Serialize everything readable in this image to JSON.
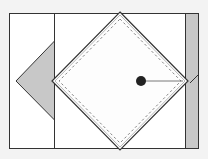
{
  "diagram": {
    "background": "#f3f3f3",
    "stroke_color": "#333333",
    "panel_fill": "#ffffff",
    "shade_fill": "#c8c8c8",
    "dot_color": "#222222",
    "outer_rect": {
      "x": 9.5,
      "y": 13.5,
      "w": 189,
      "h": 135
    },
    "left_divider_x": 54.5,
    "right_strip": {
      "x": 185.5,
      "y": 13.5,
      "w": 13,
      "h": 135
    },
    "left_triangle": [
      [
        54.5,
        41
      ],
      [
        16,
        81
      ],
      [
        54.5,
        120
      ]
    ],
    "diamond": {
      "cx": 120,
      "cy": 81,
      "half_w": 68,
      "half_h": 69
    },
    "dashed_inset": 7,
    "dot": {
      "cx": 141,
      "cy": 81,
      "r": 5
    },
    "pointer_line": {
      "x1": 141,
      "y1": 81,
      "x2": 183,
      "y2": 81
    },
    "strip_diagonal": {
      "x1": 198,
      "y1": 75,
      "x2": 190,
      "y2": 83
    }
  }
}
